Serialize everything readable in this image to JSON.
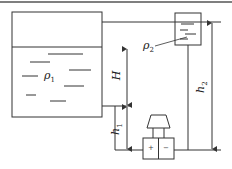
{
  "diagram": {
    "type": "liquid level measurement with differential pressure transmitter",
    "labels": {
      "rho1": "ρ",
      "rho1_sub": "1",
      "rho2": "ρ",
      "rho2_sub": "2",
      "H": "H",
      "h1": "h",
      "h1_sub": "1",
      "h2": "h",
      "h2_sub": "2",
      "plus": "+",
      "minus": "−"
    },
    "stroke_color": "#333333",
    "background": "#ffffff"
  }
}
